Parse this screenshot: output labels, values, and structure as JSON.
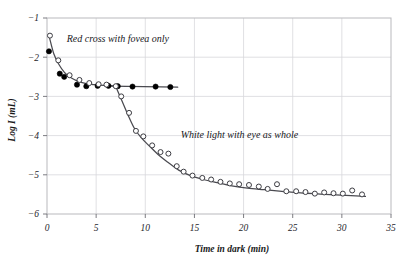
{
  "figure": {
    "background": "#ffffff",
    "frame_color": "#b9b9bd",
    "grid_color": "#d8d8dc",
    "curve_color": "#4a4a50",
    "marker_open_edge": "#3c3c42",
    "marker_filled": "#000000"
  },
  "chart_data": {
    "type": "scatter",
    "title": "",
    "xlabel": "Time in dark (min)",
    "ylabel": "Log I (mL)",
    "xlim": [
      0,
      35
    ],
    "ylim": [
      -6,
      -1
    ],
    "xticks": [
      0,
      5,
      10,
      15,
      20,
      25,
      30,
      35
    ],
    "xticklabels": [
      "0",
      "5",
      "10",
      "15",
      "20",
      "25",
      "30",
      "35"
    ],
    "yticks": [
      -6,
      -5,
      -4,
      -3,
      -2,
      -1
    ],
    "yticklabels": [
      "−6",
      "−5",
      "−4",
      "−3",
      "−2",
      "−1"
    ],
    "grid": true,
    "legend": "none",
    "annotations": [
      {
        "text": "Red cross with fovea only",
        "x": 2.0,
        "y": -1.62,
        "series": "cone-branch"
      },
      {
        "text": "White light with eye as whole",
        "x": 13.6,
        "y": -4.06,
        "series": "rod-branch"
      }
    ],
    "series": [
      {
        "name": "Red cross with fovea only",
        "marker": "filled-circle",
        "points": [
          [
            0.2,
            -1.85
          ],
          [
            1.3,
            -2.42
          ],
          [
            1.75,
            -2.5
          ],
          [
            3.05,
            -2.7
          ],
          [
            4.0,
            -2.74
          ],
          [
            5.15,
            -2.73
          ],
          [
            6.25,
            -2.73
          ],
          [
            7.2,
            -2.74
          ],
          [
            8.7,
            -2.75
          ],
          [
            11.05,
            -2.75
          ],
          [
            12.55,
            -2.76
          ]
        ]
      },
      {
        "name": "White light with eye as whole",
        "marker": "open-circle",
        "points": [
          [
            0.3,
            -1.45
          ],
          [
            1.15,
            -2.08
          ],
          [
            2.3,
            -2.46
          ],
          [
            3.3,
            -2.58
          ],
          [
            4.3,
            -2.66
          ],
          [
            5.25,
            -2.69
          ],
          [
            6.05,
            -2.7
          ],
          [
            7.0,
            -2.74
          ],
          [
            7.55,
            -3.0
          ],
          [
            8.35,
            -3.42
          ],
          [
            9.05,
            -3.88
          ],
          [
            9.8,
            -4.02
          ],
          [
            10.7,
            -4.25
          ],
          [
            11.55,
            -4.42
          ],
          [
            12.35,
            -4.46
          ],
          [
            13.2,
            -4.78
          ],
          [
            13.9,
            -4.92
          ],
          [
            14.8,
            -5.02
          ],
          [
            15.8,
            -5.08
          ],
          [
            16.7,
            -5.12
          ],
          [
            17.65,
            -5.18
          ],
          [
            18.6,
            -5.22
          ],
          [
            19.55,
            -5.24
          ],
          [
            20.55,
            -5.26
          ],
          [
            21.55,
            -5.3
          ],
          [
            22.45,
            -5.36
          ],
          [
            23.4,
            -5.24
          ],
          [
            24.35,
            -5.42
          ],
          [
            25.35,
            -5.42
          ],
          [
            26.3,
            -5.44
          ],
          [
            27.25,
            -5.48
          ],
          [
            28.2,
            -5.45
          ],
          [
            29.15,
            -5.47
          ],
          [
            30.1,
            -5.48
          ],
          [
            31.05,
            -5.4
          ],
          [
            32.05,
            -5.5
          ]
        ]
      }
    ],
    "fit_curves": [
      {
        "name": "cone-fit",
        "description": "cone branch decay to plateau",
        "path": [
          [
            0.25,
            -1.5
          ],
          [
            0.7,
            -1.92
          ],
          [
            1.2,
            -2.18
          ],
          [
            1.75,
            -2.38
          ],
          [
            2.4,
            -2.52
          ],
          [
            3.1,
            -2.61
          ],
          [
            3.9,
            -2.67
          ],
          [
            4.8,
            -2.7
          ],
          [
            5.8,
            -2.72
          ],
          [
            7.0,
            -2.735
          ]
        ]
      },
      {
        "name": "cone-plateau",
        "description": "horizontal asymptote of cone branch",
        "path": [
          [
            6.4,
            -2.735
          ],
          [
            13.3,
            -2.765
          ]
        ]
      },
      {
        "name": "rod-fit",
        "description": "rod branch decay after rod-cone break",
        "path": [
          [
            6.95,
            -2.72
          ],
          [
            7.6,
            -3.1
          ],
          [
            8.25,
            -3.48
          ],
          [
            8.9,
            -3.82
          ],
          [
            9.6,
            -4.06
          ],
          [
            10.4,
            -4.26
          ],
          [
            11.3,
            -4.48
          ],
          [
            12.3,
            -4.68
          ],
          [
            13.4,
            -4.88
          ],
          [
            14.6,
            -5.02
          ],
          [
            15.9,
            -5.12
          ],
          [
            17.3,
            -5.2
          ],
          [
            18.8,
            -5.28
          ],
          [
            20.4,
            -5.34
          ],
          [
            22.1,
            -5.38
          ],
          [
            23.9,
            -5.42
          ],
          [
            25.8,
            -5.46
          ],
          [
            27.8,
            -5.49
          ],
          [
            29.9,
            -5.52
          ],
          [
            32.4,
            -5.55
          ]
        ]
      }
    ]
  }
}
